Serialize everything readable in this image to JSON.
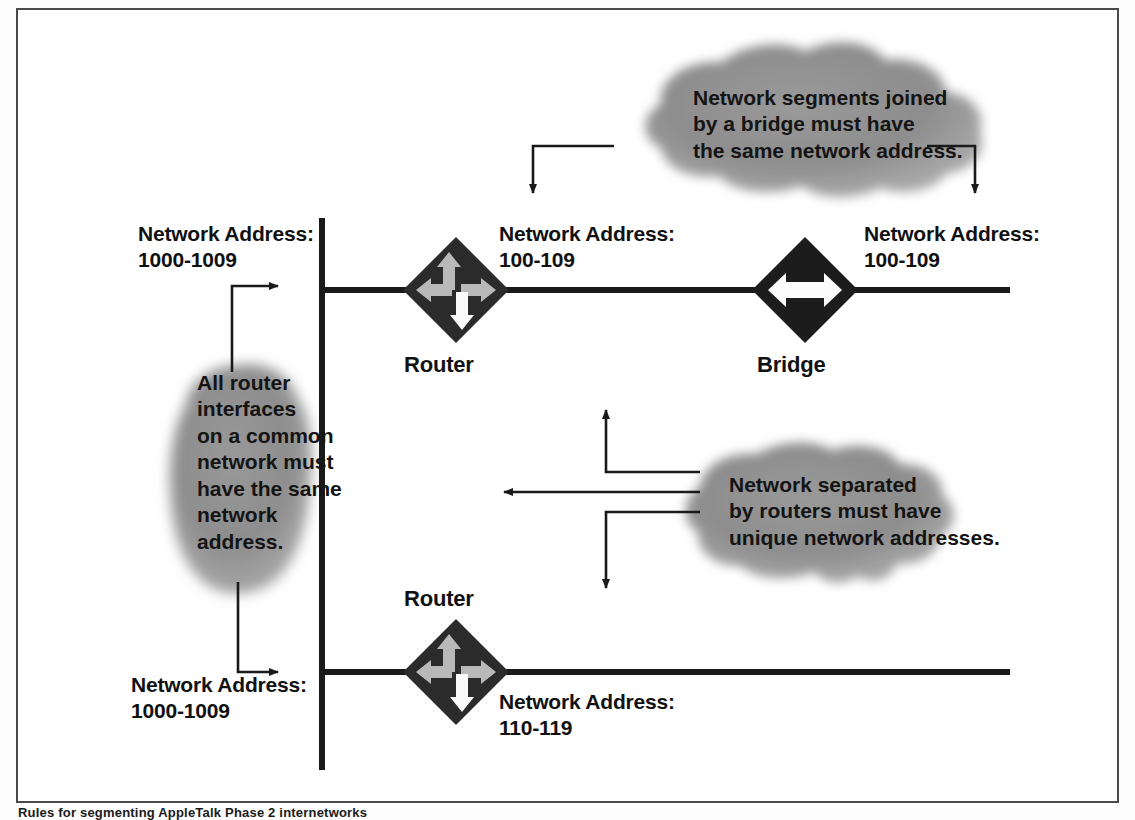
{
  "figure": {
    "caption": "Rules for segmenting AppleTalk Phase 2 internetworks",
    "border_color": "#4a4a4a",
    "line_color": "#1a1a1a",
    "cloud_fill": "#8c8c8c"
  },
  "segments": {
    "top_left": {
      "address_title": "Network Address:",
      "address_range": "1000-1009"
    },
    "top_middle": {
      "address_title": "Network Address:",
      "address_range": "100-109"
    },
    "top_right": {
      "address_title": "Network Address:",
      "address_range": "100-109"
    },
    "bottom_left": {
      "address_title": "Network Address:",
      "address_range": "1000-1009"
    },
    "bottom_middle": {
      "address_title": "Network Address:",
      "address_range": "110-119"
    }
  },
  "devices": [
    {
      "id": "router-top",
      "label": "Router",
      "type": "router",
      "icon": "four-way-arrow-icon"
    },
    {
      "id": "bridge-top",
      "label": "Bridge",
      "type": "bridge",
      "icon": "double-arrow-icon"
    },
    {
      "id": "router-bottom",
      "label": "Router",
      "type": "router",
      "icon": "four-way-arrow-icon"
    }
  ],
  "callouts": {
    "bridge_rule": {
      "id": "callout-bridge-rule",
      "lines": [
        "Network segments joined",
        "by a bridge must have",
        "the same network address."
      ],
      "text": "Network segments joined\nby a bridge must have\nthe same network address."
    },
    "router_interface_rule": {
      "id": "callout-router-interface-rule",
      "lines": [
        "All router",
        "interfaces",
        "on a common",
        "network must",
        "have the same",
        "network",
        "address."
      ],
      "text": "All router\ninterfaces\non a common\nnetwork must\nhave the same\nnetwork\naddress."
    },
    "router_separation_rule": {
      "id": "callout-router-separation-rule",
      "lines": [
        "Network separated",
        "by routers must have",
        "unique network addresses."
      ],
      "text": "Network separated\nby routers must have\nunique network addresses."
    }
  }
}
